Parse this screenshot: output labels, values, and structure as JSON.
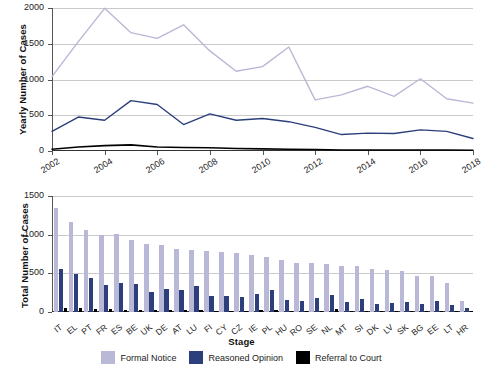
{
  "colors": {
    "formal_notice": "#b9b8d6",
    "reasoned_opinion": "#2c3f7c",
    "referral_to_court": "#000000",
    "gridline": "#c9c9c9",
    "axis": "#333333"
  },
  "legend": {
    "items": [
      {
        "label": "Formal Notice",
        "color": "#b9b8d6",
        "key": "formal_notice"
      },
      {
        "label": "Reasoned Opinion",
        "color": "#2c3f7c",
        "key": "reasoned_opinion"
      },
      {
        "label": "Referral to Court",
        "color": "#000000",
        "key": "referral_to_court"
      }
    ]
  },
  "chart_data": [
    {
      "type": "line",
      "id": "yearly-cases-by-stage",
      "title": "",
      "xlabel": "",
      "ylabel": "Yearly Number of Cases",
      "ylim": [
        0,
        2000
      ],
      "yticks": [
        0,
        500,
        1000,
        1500,
        2000
      ],
      "ytick_labels": [
        "0",
        "500",
        "1000",
        "1500",
        "2000"
      ],
      "grid": true,
      "legend_position": "bottom-shared",
      "x": [
        2002,
        2003,
        2004,
        2005,
        2006,
        2007,
        2008,
        2009,
        2010,
        2011,
        2012,
        2013,
        2014,
        2015,
        2016,
        2017,
        2018
      ],
      "xtick_labels": [
        "2002",
        "2004",
        "2006",
        "2008",
        "2010",
        "2012",
        "2014",
        "2016",
        "2018"
      ],
      "xticks": [
        2002,
        2004,
        2006,
        2008,
        2010,
        2012,
        2014,
        2016,
        2018
      ],
      "series": [
        {
          "name": "Formal Notice",
          "color": "#b9b8d6",
          "values": [
            1040,
            1530,
            1995,
            1655,
            1575,
            1765,
            1400,
            1115,
            1180,
            1455,
            715,
            785,
            905,
            765,
            1010,
            730,
            670
          ]
        },
        {
          "name": "Reasoned Opinion",
          "color": "#2c3f7c",
          "values": [
            275,
            475,
            430,
            705,
            650,
            370,
            520,
            430,
            455,
            410,
            330,
            230,
            250,
            245,
            295,
            275,
            175
          ]
        },
        {
          "name": "Referral to Court",
          "color": "#000000",
          "values": [
            25,
            55,
            75,
            85,
            55,
            50,
            45,
            35,
            30,
            25,
            20,
            15,
            15,
            15,
            15,
            15,
            10
          ]
        }
      ]
    },
    {
      "type": "bar",
      "id": "total-cases-by-member-state",
      "title": "",
      "xlabel": "Stage",
      "ylabel": "Total Number of Cases",
      "ylim": [
        0,
        1500
      ],
      "yticks": [
        0,
        500,
        1000,
        1500
      ],
      "ytick_labels": [
        "0",
        "500",
        "1000",
        "1500"
      ],
      "grid": true,
      "legend_position": "bottom",
      "categories": [
        "IT",
        "EL",
        "PT",
        "FR",
        "ES",
        "BE",
        "UK",
        "DE",
        "AT",
        "LU",
        "FI",
        "CY",
        "CZ",
        "IE",
        "PL",
        "HU",
        "RO",
        "SE",
        "NL",
        "MT",
        "SI",
        "DK",
        "LV",
        "SK",
        "BG",
        "EE",
        "LT",
        "HR"
      ],
      "series": [
        {
          "name": "Formal Notice",
          "color": "#b9b8d6",
          "values": [
            1345,
            1160,
            1065,
            1000,
            1005,
            935,
            885,
            870,
            820,
            800,
            785,
            775,
            760,
            740,
            715,
            670,
            630,
            630,
            620,
            600,
            600,
            550,
            545,
            530,
            470,
            465,
            375,
            140
          ]
        },
        {
          "name": "Reasoned Opinion",
          "color": "#2c3f7c",
          "values": [
            560,
            490,
            435,
            355,
            370,
            360,
            260,
            300,
            290,
            340,
            210,
            205,
            200,
            235,
            280,
            150,
            140,
            180,
            215,
            125,
            165,
            105,
            120,
            130,
            110,
            145,
            90,
            55
          ]
        },
        {
          "name": "Referral to Court",
          "color": "#000000",
          "values": [
            50,
            50,
            45,
            35,
            30,
            25,
            25,
            25,
            20,
            25,
            15,
            15,
            15,
            20,
            25,
            10,
            10,
            15,
            35,
            10,
            10,
            10,
            10,
            10,
            5,
            5,
            5,
            5
          ]
        }
      ]
    }
  ]
}
